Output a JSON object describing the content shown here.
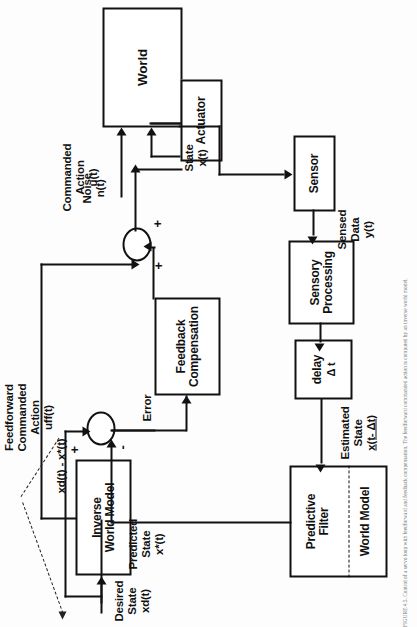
{
  "figure": {
    "caption": "FIGURE 4.5.  Control of a servo loop with feedforward and feedback compensation. The feedforward commanded action is computed by an inverse world model."
  },
  "blocks": {
    "world": {
      "lines": [
        "World"
      ]
    },
    "actuator": {
      "lines": [
        "Actuator"
      ]
    },
    "sensor": {
      "lines": [
        "Sensor"
      ]
    },
    "sensory_processing": {
      "lines": [
        "Sensory",
        "Processing"
      ]
    },
    "delay": {
      "lines": [
        "delay",
        "Δ t"
      ]
    },
    "predictive_filter": {
      "lines": [
        "Predictive",
        "Filter"
      ]
    },
    "world_model": {
      "lines": [
        "World Model"
      ]
    },
    "feedback_compensation": {
      "lines": [
        "Feedback",
        "Compensation"
      ]
    },
    "inverse_world_model": {
      "lines": [
        "Inverse",
        "World Model"
      ]
    }
  },
  "signals": {
    "noise": {
      "lines": [
        "Noise",
        "n(t)"
      ]
    },
    "state": {
      "lines": [
        "State",
        "x(t)"
      ]
    },
    "sensed_data": {
      "lines": [
        "Sensed",
        "Data",
        "y(t)"
      ]
    },
    "estimated_state": {
      "lines": [
        "Estimated",
        "State",
        "x(t- Δt)"
      ]
    },
    "predicted_state": {
      "lines": [
        "Predicted",
        "State",
        "x*(t)"
      ]
    },
    "commanded_action": {
      "lines": [
        "Commanded",
        "Action",
        "u(t)"
      ]
    },
    "feedforward_action": {
      "lines": [
        "Feedforward",
        "Commanded",
        "Action",
        "uff(t)"
      ]
    },
    "desired_state": {
      "lines": [
        "Desired",
        "State",
        "xd(t)"
      ]
    },
    "error": {
      "lines": [
        "Error"
      ]
    },
    "error_expression": {
      "lines": [
        "xd(t) - x*(t)"
      ]
    }
  },
  "signs": {
    "sum_u_plus_left": "+",
    "sum_u_plus_right": "+",
    "sum_e_plus": "+",
    "sum_e_minus": "-"
  },
  "colors": {
    "ink": "#111111",
    "paper": "#fdfdfd",
    "caption": "#7a7a7a"
  }
}
